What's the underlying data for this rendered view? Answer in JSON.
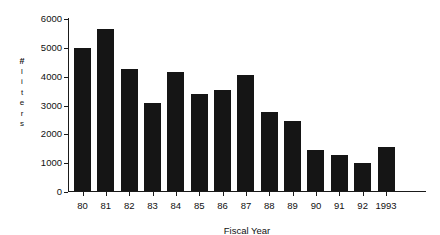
{
  "chart_data": {
    "type": "bar",
    "title": "",
    "xlabel": "Fiscal Year",
    "ylabel": "# liters",
    "ylabel_chars": [
      "#",
      "l",
      "i",
      "t",
      "e",
      "r",
      "s"
    ],
    "categories": [
      "80",
      "81",
      "82",
      "83",
      "84",
      "85",
      "86",
      "87",
      "88",
      "89",
      "90",
      "91",
      "92",
      "1993"
    ],
    "values": [
      5000,
      5650,
      4250,
      3100,
      4150,
      3400,
      3550,
      4050,
      2790,
      2450,
      1450,
      1300,
      1000,
      1550
    ],
    "ylim": [
      0,
      6000
    ],
    "yticks": [
      0,
      1000,
      2000,
      3000,
      4000,
      5000,
      6000
    ],
    "ytick_labels": [
      "0",
      "1000",
      "2000",
      "3000",
      "4000",
      "5000",
      "6000"
    ],
    "grid": false,
    "legend": null,
    "bar_color": "#151515",
    "axis_color": "#1a1a1a",
    "background": "#ffffff"
  }
}
